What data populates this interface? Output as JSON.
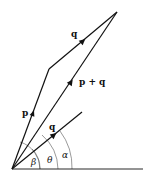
{
  "diagram": {
    "type": "vector-addition-parallelogram",
    "stroke_color": "#111111",
    "arc_color": "#555555",
    "points": {
      "origin": [
        12,
        169
      ],
      "p_end": [
        49,
        69
      ],
      "sum_end": [
        117,
        12
      ],
      "q_end": [
        82,
        112
      ],
      "axis_end": [
        143,
        169
      ]
    },
    "labels": {
      "p": "p",
      "q_top": "q",
      "p_plus_q": "p + q",
      "q_bottom": "q",
      "beta": "β",
      "theta": "θ",
      "alpha": "α"
    }
  }
}
